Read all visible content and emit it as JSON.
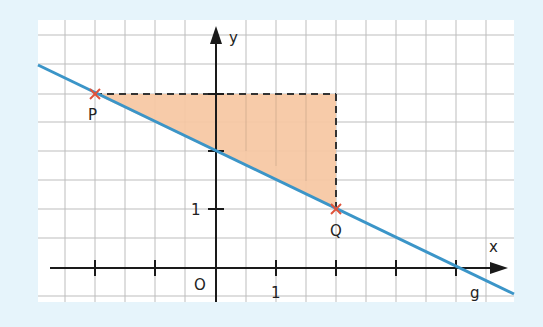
{
  "diagram": {
    "title": "",
    "colors": {
      "background": "#e6f4fb",
      "paper": "#ffffff",
      "grid": "#b9b9b9",
      "axes": "#1a1a1a",
      "line": "#3b95c8",
      "triangle_fill": "#f6c7a2",
      "points": "#e0533a"
    },
    "axes": {
      "x_label": "x",
      "y_label": "y",
      "origin_label": "O",
      "x_unit_label": "1",
      "y_unit_label": "1"
    },
    "line": {
      "label": "g",
      "equation": "y = -0.5x + 2",
      "slope": -0.5,
      "intercept": 2
    },
    "points": [
      {
        "label": "P",
        "x": -2,
        "y": 3
      },
      {
        "label": "Q",
        "x": 2,
        "y": 1
      }
    ],
    "slope_triangle": {
      "vertices": [
        [
          -2,
          3
        ],
        [
          2,
          3
        ],
        [
          2,
          1
        ]
      ],
      "style": "dashed legs, orange fill"
    }
  }
}
